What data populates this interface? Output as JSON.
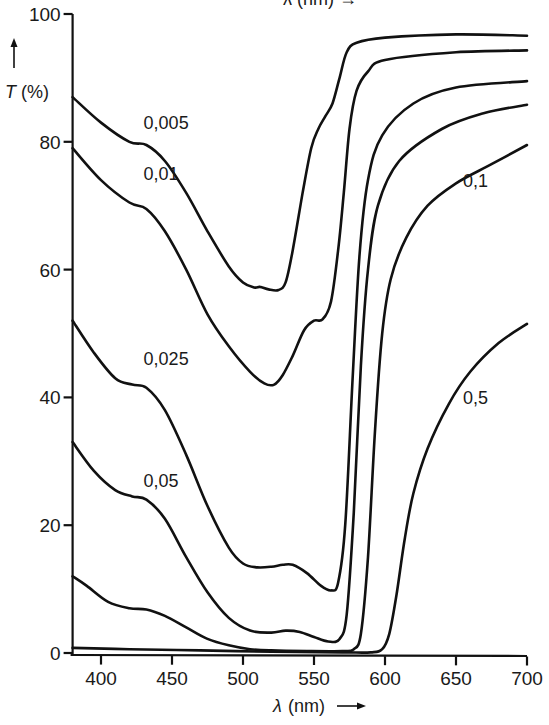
{
  "chart_data": {
    "type": "line",
    "title": "",
    "top_cropped_label": "λ (nm) →",
    "xlabel": "λ (nm)",
    "ylabel": "T (%)",
    "xlim": [
      380,
      700
    ],
    "ylim": [
      0,
      100
    ],
    "x_ticks": [
      400,
      450,
      500,
      550,
      600,
      650,
      700
    ],
    "y_ticks": [
      0,
      20,
      40,
      60,
      80,
      100
    ],
    "grid": false,
    "legend": "inline curve labels",
    "series": [
      {
        "name": "0,005",
        "label_pos": [
          430,
          82
        ],
        "points": [
          [
            380,
            87
          ],
          [
            400,
            83
          ],
          [
            420,
            80
          ],
          [
            432,
            79.5
          ],
          [
            445,
            77
          ],
          [
            460,
            72
          ],
          [
            475,
            66
          ],
          [
            490,
            60.5
          ],
          [
            500,
            58
          ],
          [
            508,
            57.2
          ],
          [
            512,
            57.3
          ],
          [
            518,
            56.9
          ],
          [
            525,
            56.8
          ],
          [
            530,
            58
          ],
          [
            535,
            63
          ],
          [
            542,
            72
          ],
          [
            548,
            79
          ],
          [
            553,
            82
          ],
          [
            558,
            84
          ],
          [
            563,
            86
          ],
          [
            568,
            90
          ],
          [
            573,
            94
          ],
          [
            580,
            95.5
          ],
          [
            600,
            96.3
          ],
          [
            650,
            96.8
          ],
          [
            700,
            96.6
          ]
        ]
      },
      {
        "name": "0,01",
        "label_pos": [
          430,
          74
        ],
        "points": [
          [
            380,
            79
          ],
          [
            400,
            74
          ],
          [
            420,
            70.5
          ],
          [
            432,
            69.5
          ],
          [
            445,
            66
          ],
          [
            460,
            60
          ],
          [
            475,
            53
          ],
          [
            490,
            48
          ],
          [
            505,
            44
          ],
          [
            515,
            42.2
          ],
          [
            522,
            42
          ],
          [
            528,
            43.5
          ],
          [
            535,
            46.5
          ],
          [
            543,
            50.5
          ],
          [
            550,
            52
          ],
          [
            556,
            52.2
          ],
          [
            562,
            55
          ],
          [
            567,
            63
          ],
          [
            571,
            72
          ],
          [
            575,
            82
          ],
          [
            580,
            88
          ],
          [
            588,
            91
          ],
          [
            600,
            92.8
          ],
          [
            650,
            94
          ],
          [
            700,
            94.3
          ]
        ]
      },
      {
        "name": "0,025",
        "label_pos": [
          430,
          45
        ],
        "points": [
          [
            380,
            52
          ],
          [
            395,
            47
          ],
          [
            410,
            43
          ],
          [
            422,
            42
          ],
          [
            432,
            41.5
          ],
          [
            445,
            38
          ],
          [
            460,
            31
          ],
          [
            475,
            23
          ],
          [
            490,
            16.5
          ],
          [
            500,
            14
          ],
          [
            510,
            13.4
          ],
          [
            520,
            13.5
          ],
          [
            528,
            13.8
          ],
          [
            535,
            13.8
          ],
          [
            545,
            12.5
          ],
          [
            555,
            10.5
          ],
          [
            562,
            9.8
          ],
          [
            567,
            11
          ],
          [
            572,
            20
          ],
          [
            577,
            42
          ],
          [
            582,
            62
          ],
          [
            588,
            74
          ],
          [
            598,
            81
          ],
          [
            620,
            86
          ],
          [
            650,
            88.5
          ],
          [
            700,
            89.5
          ]
        ]
      },
      {
        "name": "0,05",
        "label_pos": [
          430,
          26
        ],
        "points": [
          [
            380,
            33
          ],
          [
            395,
            28.5
          ],
          [
            410,
            25.5
          ],
          [
            422,
            24.5
          ],
          [
            432,
            24
          ],
          [
            445,
            21
          ],
          [
            460,
            15
          ],
          [
            475,
            9.5
          ],
          [
            490,
            5.5
          ],
          [
            505,
            3.5
          ],
          [
            520,
            3.2
          ],
          [
            530,
            3.5
          ],
          [
            540,
            3.3
          ],
          [
            550,
            2.5
          ],
          [
            560,
            1.8
          ],
          [
            568,
            2.2
          ],
          [
            573,
            6
          ],
          [
            578,
            22
          ],
          [
            583,
            45
          ],
          [
            588,
            60
          ],
          [
            595,
            70
          ],
          [
            610,
            77
          ],
          [
            640,
            82
          ],
          [
            670,
            84.5
          ],
          [
            700,
            85.8
          ]
        ]
      },
      {
        "name": "0,1",
        "label_pos": [
          655,
          73
        ],
        "points": [
          [
            380,
            12
          ],
          [
            390,
            10.5
          ],
          [
            405,
            8
          ],
          [
            420,
            7
          ],
          [
            432,
            6.8
          ],
          [
            445,
            5.8
          ],
          [
            460,
            4
          ],
          [
            475,
            2.2
          ],
          [
            490,
            1.2
          ],
          [
            505,
            0.6
          ],
          [
            520,
            0.4
          ],
          [
            545,
            0.3
          ],
          [
            570,
            0.3
          ],
          [
            578,
            0.6
          ],
          [
            583,
            3
          ],
          [
            588,
            15
          ],
          [
            593,
            35
          ],
          [
            598,
            50
          ],
          [
            604,
            58.5
          ],
          [
            615,
            65
          ],
          [
            630,
            70
          ],
          [
            650,
            73.5
          ],
          [
            675,
            76.5
          ],
          [
            700,
            79.5
          ]
        ]
      },
      {
        "name": "0,5",
        "label_pos": [
          655,
          39
        ],
        "points": [
          [
            380,
            0.8
          ],
          [
            420,
            0.6
          ],
          [
            470,
            0.4
          ],
          [
            520,
            0.2
          ],
          [
            570,
            0.1
          ],
          [
            590,
            0.1
          ],
          [
            598,
            0.6
          ],
          [
            603,
            3
          ],
          [
            608,
            9
          ],
          [
            614,
            18
          ],
          [
            620,
            25
          ],
          [
            630,
            32
          ],
          [
            645,
            39
          ],
          [
            660,
            44
          ],
          [
            680,
            48.5
          ],
          [
            700,
            51.5
          ]
        ]
      }
    ]
  },
  "axes": {
    "y_title_symbol": "T",
    "y_title_unit": "(%)",
    "y_arrow": "↑",
    "x_title_symbol": "λ",
    "x_title_unit": "(nm)",
    "x_arrow": "⟶"
  }
}
